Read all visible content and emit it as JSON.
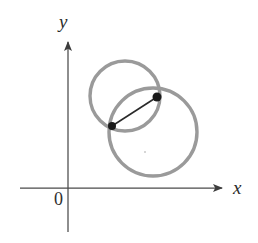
{
  "figure": {
    "background_color": "#ffffff"
  },
  "axes": {
    "x_label": "x",
    "y_label": "y",
    "origin_label": "0",
    "axis_color": "#4a4a4a",
    "x_axis": {
      "x_start": 20,
      "x_end": 226,
      "y": 188
    },
    "y_axis": {
      "x": 68,
      "y_start": 38,
      "y_end": 232
    },
    "arrowheads": [
      "x-positive",
      "y-positive"
    ]
  },
  "chart_data": {
    "type": "scatter",
    "title": "",
    "xlabel": "x",
    "ylabel": "y",
    "grid": false,
    "legend": null,
    "curve_color": "#9a9a9a",
    "point_color": "#1a1a1a",
    "chord_color": "#2a2a2a",
    "shapes": [
      {
        "name": "left-circle",
        "type": "circle",
        "center_px": [
          125,
          96
        ],
        "radius_px": 35,
        "stroke": "#9a9a9a",
        "stroke_width": 3.4
      },
      {
        "name": "right-circle",
        "type": "circle",
        "center_px": [
          153,
          132
        ],
        "radius_px": 44,
        "stroke": "#9a9a9a",
        "stroke_width": 3.4
      }
    ],
    "points": [
      {
        "name": "upper-intersection-point",
        "px": [
          157,
          97
        ],
        "marker": "filled-circle",
        "size_px": 9
      },
      {
        "name": "lower-intersection-point",
        "px": [
          112,
          126
        ],
        "marker": "filled-circle",
        "size_px": 8
      }
    ],
    "segments": [
      {
        "name": "chord-between-intersections",
        "from_px": [
          112,
          126
        ],
        "to_px": [
          157,
          97
        ],
        "stroke": "#2a2a2a",
        "stroke_width": 1.6
      }
    ],
    "speck": {
      "name": "scan-speck",
      "px": [
        145,
        152
      ],
      "radius_px": 1
    }
  }
}
